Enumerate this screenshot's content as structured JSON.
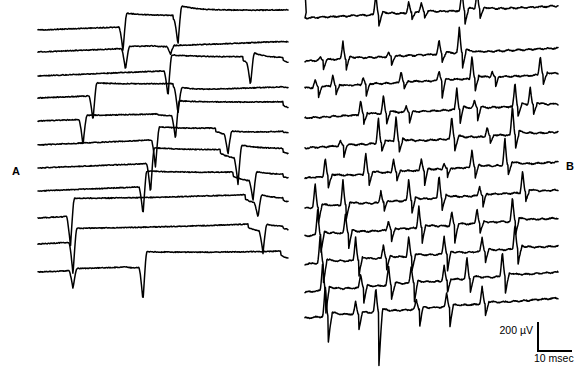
{
  "figure": {
    "type": "electrophysiology-recording",
    "background_color": "#ffffff",
    "trace_color": "#000000",
    "width": 587,
    "height": 373
  },
  "panels": [
    {
      "id": "A",
      "label": "A",
      "label_position": {
        "x": 12,
        "y": 165
      },
      "description": "monophasic downward spikes with slow plateau recovery",
      "x_start": 38,
      "x_end": 288,
      "num_sweeps": 11,
      "sweep_top": 30,
      "sweep_spacing": 23.5
    },
    {
      "id": "B",
      "label": "B",
      "label_position": {
        "x": 566,
        "y": 160
      },
      "description": "biphasic positive-negative spike trains, increasing density",
      "x_start": 305,
      "x_end": 558,
      "num_sweeps": 11,
      "sweep_top": 40,
      "sweep_spacing": 25.5
    }
  ],
  "scalebar": {
    "voltage_value": "200",
    "voltage_unit": "µV",
    "voltage_label": "200 µV",
    "time_label": "10 msec",
    "position": {
      "x": 478,
      "y": 318
    },
    "vertical_px": 30,
    "horizontal_px": 35
  },
  "chart_data": {
    "type": "line",
    "title": "",
    "xlabel": "",
    "ylabel": "",
    "legend": [],
    "grid": false,
    "scale": {
      "voltage": "200 µV",
      "time": "10 msec"
    },
    "panel_A": {
      "label": "A",
      "baseline_slope_px": -9,
      "sweeps": [
        {
          "y0": 30,
          "y1": 21,
          "events": [
            {
              "x": 0.34,
              "dir": "down",
              "amp": 24,
              "plateau": -14,
              "plateau_len": 0.2
            },
            {
              "x": 0.56,
              "dir": "down",
              "amp": 24,
              "plateau": -16,
              "plateau_len": 0.44
            }
          ]
        },
        {
          "y0": 52,
          "y1": 42,
          "events": [
            {
              "x": 0.35,
              "dir": "down",
              "amp": 22,
              "plateau": -2,
              "plateau_len": 0.12
            },
            {
              "x": 0.53,
              "dir": "down",
              "amp": 8,
              "plateau": -1,
              "plateau_len": 0.45
            }
          ]
        },
        {
          "y0": 76,
          "y1": 66,
          "events": [
            {
              "x": 0.52,
              "dir": "down",
              "amp": 26,
              "plateau": -16,
              "plateau_len": 0.3
            },
            {
              "x": 0.85,
              "dir": "down",
              "amp": 22,
              "plateau": -12,
              "plateau_len": 0.13
            }
          ]
        },
        {
          "y0": 98,
          "y1": 88,
          "events": [
            {
              "x": 0.22,
              "dir": "down",
              "amp": 25,
              "plateau": -13,
              "plateau_len": 0.32
            },
            {
              "x": 0.56,
              "dir": "down",
              "amp": 25,
              "plateau": -2,
              "plateau_len": 0.42
            }
          ]
        },
        {
          "y0": 121,
          "y1": 112,
          "events": [
            {
              "x": 0.18,
              "dir": "down",
              "amp": 26,
              "plateau": -4,
              "plateau_len": 0.3
            },
            {
              "x": 0.55,
              "dir": "down",
              "amp": 24,
              "plateau": -15,
              "plateau_len": 0.43
            }
          ]
        },
        {
          "y0": 145,
          "y1": 134,
          "events": [
            {
              "x": 0.47,
              "dir": "down",
              "amp": 28,
              "plateau": -13,
              "plateau_len": 0.24
            },
            {
              "x": 0.76,
              "dir": "down",
              "amp": 20,
              "plateau": -4,
              "plateau_len": 0.22
            }
          ]
        },
        {
          "y0": 168,
          "y1": 158,
          "events": [
            {
              "x": 0.45,
              "dir": "down",
              "amp": 30,
              "plateau": -16,
              "plateau_len": 0.28
            },
            {
              "x": 0.8,
              "dir": "down",
              "amp": 26,
              "plateau": -14,
              "plateau_len": 0.18
            }
          ]
        },
        {
          "y0": 191,
          "y1": 181,
          "events": [
            {
              "x": 0.42,
              "dir": "down",
              "amp": 28,
              "plateau": -16,
              "plateau_len": 0.36
            },
            {
              "x": 0.86,
              "dir": "down",
              "amp": 20,
              "plateau": -10,
              "plateau_len": 0.12
            }
          ]
        },
        {
          "y0": 218,
          "y1": 205,
          "events": [
            {
              "x": 0.13,
              "dir": "down",
              "amp": 30,
              "plateau": -18,
              "plateau_len": 0.7
            },
            {
              "x": 0.88,
              "dir": "down",
              "amp": 14,
              "plateau": -10,
              "plateau_len": 0.1
            }
          ]
        },
        {
          "y0": 244,
          "y1": 232,
          "events": [
            {
              "x": 0.14,
              "dir": "down",
              "amp": 32,
              "plateau": -14,
              "plateau_len": 0.7
            },
            {
              "x": 0.9,
              "dir": "down",
              "amp": 22,
              "plateau": -8,
              "plateau_len": 0.08
            }
          ]
        },
        {
          "y0": 272,
          "y1": 262,
          "events": [
            {
              "x": 0.14,
              "dir": "down",
              "amp": 18,
              "plateau": -2,
              "plateau_len": 0.22
            },
            {
              "x": 0.42,
              "dir": "down",
              "amp": 34,
              "plateau": -16,
              "plateau_len": 0.55
            }
          ]
        }
      ]
    },
    "panel_B": {
      "label": "B",
      "baseline_slope_px": -14,
      "sweeps": [
        {
          "y0": 18,
          "y1": 6,
          "leading_step": 28,
          "spikes": [
            {
              "x": 0.28,
              "up": 22,
              "down": 12
            },
            {
              "x": 0.41,
              "up": 12,
              "down": 8
            },
            {
              "x": 0.46,
              "up": 9,
              "down": 6
            },
            {
              "x": 0.62,
              "up": 20,
              "down": 14
            },
            {
              "x": 0.68,
              "up": 19,
              "down": 10
            }
          ]
        },
        {
          "y0": 61,
          "y1": 48,
          "leading_step": 0,
          "spikes": [
            {
              "x": 0.06,
              "up": 3,
              "down": 10
            },
            {
              "x": 0.15,
              "up": 18,
              "down": 12
            },
            {
              "x": 0.33,
              "up": 4,
              "down": 9
            },
            {
              "x": 0.53,
              "up": 14,
              "down": 8
            },
            {
              "x": 0.61,
              "up": 26,
              "down": 16
            }
          ]
        },
        {
          "y0": 88,
          "y1": 74,
          "leading_step": 0,
          "spikes": [
            {
              "x": 0.04,
              "up": 8,
              "down": 12
            },
            {
              "x": 0.11,
              "up": 12,
              "down": 10
            },
            {
              "x": 0.23,
              "up": 8,
              "down": 12
            },
            {
              "x": 0.38,
              "up": 12,
              "down": 7
            },
            {
              "x": 0.53,
              "up": 10,
              "down": 18
            },
            {
              "x": 0.66,
              "up": 24,
              "down": 14
            },
            {
              "x": 0.74,
              "up": 6,
              "down": 12
            },
            {
              "x": 0.93,
              "up": 20,
              "down": 10
            }
          ]
        },
        {
          "y0": 118,
          "y1": 104,
          "leading_step": 0,
          "spikes": [
            {
              "x": 0.22,
              "up": 15,
              "down": 10
            },
            {
              "x": 0.31,
              "up": 18,
              "down": 11
            },
            {
              "x": 0.4,
              "up": 6,
              "down": 12
            },
            {
              "x": 0.6,
              "up": 22,
              "down": 16
            },
            {
              "x": 0.67,
              "up": 8,
              "down": 13
            },
            {
              "x": 0.83,
              "up": 24,
              "down": 10
            },
            {
              "x": 0.89,
              "up": 18,
              "down": 12
            }
          ]
        },
        {
          "y0": 148,
          "y1": 132,
          "leading_step": 0,
          "spikes": [
            {
              "x": 0.14,
              "up": 5,
              "down": 14
            },
            {
              "x": 0.29,
              "up": 26,
              "down": 10
            },
            {
              "x": 0.36,
              "up": 26,
              "down": 12
            },
            {
              "x": 0.58,
              "up": 22,
              "down": 12
            },
            {
              "x": 0.72,
              "up": 10,
              "down": 8
            },
            {
              "x": 0.82,
              "up": 30,
              "down": 14
            }
          ]
        },
        {
          "y0": 178,
          "y1": 162,
          "leading_step": 0,
          "spikes": [
            {
              "x": 0.08,
              "up": 20,
              "down": 12
            },
            {
              "x": 0.24,
              "up": 22,
              "down": 14
            },
            {
              "x": 0.35,
              "up": 14,
              "down": 10
            },
            {
              "x": 0.46,
              "up": 12,
              "down": 16
            },
            {
              "x": 0.55,
              "up": 6,
              "down": 10
            },
            {
              "x": 0.66,
              "up": 18,
              "down": 12
            },
            {
              "x": 0.79,
              "up": 28,
              "down": 12
            }
          ]
        },
        {
          "y0": 208,
          "y1": 190,
          "leading_step": 0,
          "spikes": [
            {
              "x": 0.04,
              "up": 24,
              "down": 18
            },
            {
              "x": 0.15,
              "up": 26,
              "down": 16
            },
            {
              "x": 0.3,
              "up": 12,
              "down": 10
            },
            {
              "x": 0.41,
              "up": 22,
              "down": 14
            },
            {
              "x": 0.53,
              "up": 24,
              "down": 12
            },
            {
              "x": 0.69,
              "up": 10,
              "down": 14
            },
            {
              "x": 0.86,
              "up": 22,
              "down": 10
            }
          ]
        },
        {
          "y0": 236,
          "y1": 218,
          "leading_step": 0,
          "spikes": [
            {
              "x": 0.05,
              "up": 26,
              "down": 20
            },
            {
              "x": 0.16,
              "up": 20,
              "down": 16
            },
            {
              "x": 0.33,
              "up": 10,
              "down": 12
            },
            {
              "x": 0.45,
              "up": 22,
              "down": 18
            },
            {
              "x": 0.58,
              "up": 14,
              "down": 18
            },
            {
              "x": 0.68,
              "up": 16,
              "down": 10
            },
            {
              "x": 0.82,
              "up": 24,
              "down": 14
            }
          ]
        },
        {
          "y0": 264,
          "y1": 246,
          "leading_step": 0,
          "spikes": [
            {
              "x": 0.06,
              "up": 28,
              "down": 22
            },
            {
              "x": 0.2,
              "up": 24,
              "down": 18
            },
            {
              "x": 0.31,
              "up": 14,
              "down": 12
            },
            {
              "x": 0.41,
              "up": 20,
              "down": 16
            },
            {
              "x": 0.55,
              "up": 18,
              "down": 20
            },
            {
              "x": 0.7,
              "up": 14,
              "down": 12
            },
            {
              "x": 0.83,
              "up": 26,
              "down": 16
            }
          ]
        },
        {
          "y0": 292,
          "y1": 272,
          "leading_step": 0,
          "spikes": [
            {
              "x": 0.07,
              "up": 30,
              "down": 24
            },
            {
              "x": 0.22,
              "up": 14,
              "down": 16
            },
            {
              "x": 0.33,
              "up": 20,
              "down": 14
            },
            {
              "x": 0.42,
              "up": 18,
              "down": 20
            },
            {
              "x": 0.55,
              "up": 16,
              "down": 14
            },
            {
              "x": 0.64,
              "up": 22,
              "down": 16
            },
            {
              "x": 0.78,
              "up": 26,
              "down": 18
            }
          ]
        },
        {
          "y0": 318,
          "y1": 298,
          "leading_step": 0,
          "spikes": [
            {
              "x": 0.08,
              "up": 32,
              "down": 26
            },
            {
              "x": 0.2,
              "up": 12,
              "down": 18
            },
            {
              "x": 0.28,
              "up": 24,
              "down": 54
            },
            {
              "x": 0.44,
              "up": 10,
              "down": 20
            },
            {
              "x": 0.56,
              "up": 14,
              "down": 22
            },
            {
              "x": 0.7,
              "up": 18,
              "down": 14
            }
          ]
        }
      ]
    }
  }
}
